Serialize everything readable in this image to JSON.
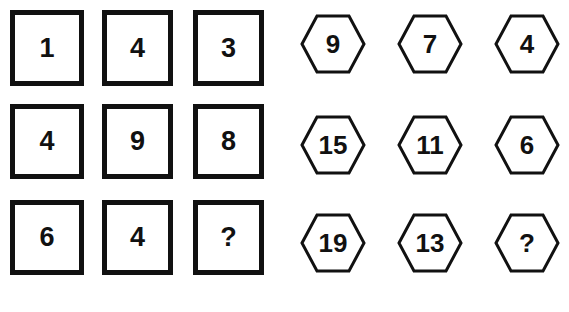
{
  "puzzle": {
    "squares": [
      [
        "1",
        "4",
        "3"
      ],
      [
        "4",
        "9",
        "8"
      ],
      [
        "6",
        "4",
        "?"
      ]
    ],
    "hexagons": [
      [
        "9",
        "7",
        "4"
      ],
      [
        "15",
        "11",
        "6"
      ],
      [
        "19",
        "13",
        "?"
      ]
    ]
  }
}
